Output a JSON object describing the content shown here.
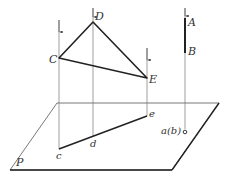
{
  "diagram": {
    "plane": {
      "label": "P",
      "corners": [
        [
          57,
          103
        ],
        [
          219,
          103
        ],
        [
          172,
          170
        ],
        [
          10,
          170
        ]
      ]
    },
    "points_space": [
      {
        "label": "C",
        "x": 59,
        "y": 58
      },
      {
        "label": "D",
        "x": 93,
        "y": 22
      },
      {
        "label": "E",
        "x": 147,
        "y": 78
      },
      {
        "label": "A",
        "x": 185,
        "y": 18
      },
      {
        "label": "B",
        "x": 185,
        "y": 53
      }
    ],
    "points_projected": [
      {
        "label": "c",
        "x": 59,
        "y": 149
      },
      {
        "label": "d",
        "x": 93,
        "y": 137
      },
      {
        "label": "e",
        "x": 147,
        "y": 116
      },
      {
        "label": "a(b)",
        "x": 185,
        "y": 132
      }
    ],
    "labels": {
      "C": "C",
      "D": "D",
      "E": "E",
      "A": "A",
      "B": "B",
      "c": "c",
      "d": "d",
      "e": "e",
      "ab": "a(b)",
      "P": "P"
    },
    "colors": {
      "line": "#222222",
      "thin": "#666666"
    }
  }
}
